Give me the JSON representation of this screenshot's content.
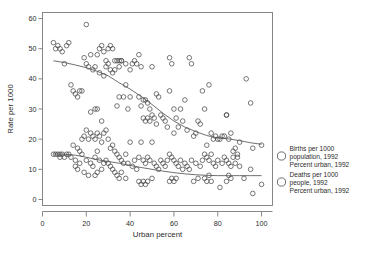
{
  "figure": {
    "clipped_header_text": "",
    "background_color": "#ffffff",
    "frame_color": "#7a7a7a",
    "marker_color": "#4a4a4a",
    "line_color": "#555555"
  },
  "axes": {
    "x": {
      "title": "Urban percent",
      "ticks": [
        0,
        20,
        40,
        60,
        80,
        100
      ],
      "min": 0,
      "max": 105
    },
    "y": {
      "title": "Rate per 1000",
      "ticks": [
        0,
        10,
        20,
        30,
        40,
        50,
        60
      ],
      "min": -2,
      "max": 62
    }
  },
  "legend": {
    "entries": [
      {
        "marker": "open-circle",
        "lines": [
          "Births per 1000",
          "population, 1992",
          "Percent urban, 1992"
        ]
      },
      {
        "marker": "open-circle",
        "lines": [
          "Deaths per 1000",
          "people, 1992",
          "Percent urban, 1992"
        ]
      }
    ]
  },
  "chart_data": {
    "type": "scatter",
    "title": "",
    "xlabel": "Urban percent",
    "ylabel": "Rate per 1000",
    "xlim": [
      0,
      105
    ],
    "ylim": [
      -2,
      62
    ],
    "xticks": [
      0,
      20,
      40,
      60,
      80,
      100
    ],
    "yticks": [
      0,
      10,
      20,
      30,
      40,
      50,
      60
    ],
    "grid": false,
    "legend_position": "right",
    "marker_style": "open circle",
    "series": [
      {
        "name": "Births per 1000 population, 1992",
        "x": [
          5,
          6,
          7,
          8,
          9,
          10,
          11,
          12,
          13,
          14,
          15,
          16,
          17,
          18,
          19,
          20,
          20,
          21,
          22,
          22,
          23,
          24,
          24,
          25,
          25,
          26,
          26,
          27,
          27,
          28,
          28,
          29,
          29,
          30,
          30,
          31,
          31,
          32,
          32,
          33,
          33,
          34,
          34,
          35,
          35,
          35,
          36,
          36,
          37,
          38,
          38,
          39,
          40,
          40,
          41,
          42,
          43,
          44,
          44,
          45,
          45,
          46,
          46,
          47,
          47,
          48,
          48,
          49,
          49,
          50,
          50,
          51,
          52,
          52,
          53,
          54,
          55,
          56,
          57,
          58,
          58,
          59,
          60,
          60,
          61,
          62,
          63,
          64,
          65,
          66,
          67,
          68,
          69,
          70,
          71,
          72,
          73,
          74,
          75,
          76,
          77,
          78,
          79,
          80,
          81,
          82,
          83,
          84,
          84,
          85,
          86,
          87,
          88,
          89,
          90,
          93,
          95,
          96,
          100
        ],
        "y": [
          52,
          50,
          51,
          50,
          49,
          45,
          51,
          52,
          38,
          36,
          35,
          34,
          36,
          36,
          47,
          58,
          45,
          44,
          48,
          29,
          43,
          44,
          30,
          48,
          30,
          50,
          42,
          51,
          26,
          49,
          41,
          46,
          44,
          50,
          45,
          51,
          43,
          50,
          42,
          46,
          43,
          46,
          31,
          46,
          44,
          34,
          46,
          46,
          34,
          45,
          38,
          30,
          43,
          34,
          45,
          46,
          45,
          48,
          34,
          44,
          31,
          33,
          27,
          33,
          26,
          32,
          27,
          30,
          26,
          44,
          28,
          27,
          35,
          25,
          34,
          28,
          27,
          26,
          24,
          47,
          36,
          45,
          30,
          22,
          27,
          24,
          30,
          26,
          33,
          23,
          47,
          45,
          21,
          22,
          26,
          25,
          36,
          30,
          18,
          38,
          22,
          20,
          21,
          20,
          20,
          21,
          21,
          28,
          28,
          20,
          22,
          16,
          17,
          14,
          19,
          40,
          32,
          17,
          18
        ]
      },
      {
        "name": "Deaths per 1000 people, 1992",
        "x": [
          5,
          6,
          7,
          8,
          8,
          9,
          10,
          11,
          12,
          13,
          14,
          15,
          15,
          16,
          16,
          17,
          17,
          18,
          18,
          19,
          19,
          20,
          20,
          21,
          21,
          22,
          22,
          23,
          23,
          24,
          24,
          24,
          25,
          25,
          25,
          26,
          26,
          27,
          27,
          28,
          28,
          29,
          29,
          30,
          30,
          31,
          31,
          32,
          32,
          33,
          33,
          34,
          34,
          35,
          35,
          36,
          36,
          37,
          38,
          38,
          39,
          40,
          41,
          42,
          43,
          44,
          44,
          45,
          45,
          46,
          46,
          47,
          47,
          48,
          48,
          49,
          50,
          50,
          51,
          52,
          53,
          54,
          55,
          56,
          57,
          58,
          58,
          59,
          59,
          60,
          60,
          61,
          61,
          62,
          63,
          64,
          65,
          66,
          67,
          68,
          69,
          70,
          71,
          72,
          73,
          74,
          74,
          75,
          75,
          76,
          76,
          77,
          77,
          78,
          79,
          80,
          81,
          82,
          83,
          84,
          84,
          85,
          85,
          86,
          86,
          87,
          88,
          89,
          90,
          92,
          95,
          96,
          100
        ],
        "y": [
          15,
          15,
          15,
          15,
          14,
          15,
          14,
          15,
          15,
          14,
          18,
          13,
          11,
          17,
          10,
          16,
          12,
          20,
          15,
          21,
          9,
          23,
          13,
          20,
          8,
          22,
          12,
          21,
          11,
          20,
          14,
          8,
          22,
          16,
          9,
          21,
          13,
          19,
          10,
          22,
          12,
          23,
          13,
          20,
          12,
          17,
          11,
          18,
          10,
          16,
          9,
          15,
          8,
          14,
          7,
          13,
          9,
          12,
          15,
          7,
          12,
          19,
          11,
          13,
          10,
          14,
          6,
          19,
          5,
          13,
          6,
          12,
          5,
          14,
          6,
          13,
          19,
          7,
          12,
          11,
          10,
          13,
          12,
          11,
          13,
          15,
          6,
          14,
          7,
          13,
          6,
          12,
          7,
          11,
          13,
          10,
          12,
          11,
          10,
          13,
          6,
          12,
          7,
          11,
          13,
          15,
          7,
          14,
          6,
          13,
          8,
          15,
          6,
          12,
          11,
          13,
          4,
          12,
          14,
          13,
          6,
          12,
          8,
          11,
          7,
          14,
          12,
          15,
          11,
          7,
          10,
          2,
          5
        ]
      }
    ],
    "trend_lines": [
      {
        "name": "births-lowess",
        "x": [
          5,
          10,
          15,
          20,
          25,
          30,
          35,
          40,
          45,
          50,
          55,
          60,
          65,
          70,
          75,
          80,
          85,
          90,
          95,
          100
        ],
        "y": [
          46,
          45.4,
          44.6,
          43.7,
          42.5,
          41.0,
          38.7,
          36.6,
          34.2,
          31.5,
          28.6,
          26.0,
          24.0,
          22.5,
          21.2,
          20.4,
          20.1,
          19.5,
          18.8,
          18.3
        ]
      },
      {
        "name": "deaths-lowess",
        "x": [
          5,
          10,
          15,
          20,
          25,
          30,
          35,
          40,
          45,
          50,
          55,
          60,
          65,
          70,
          75,
          80,
          85,
          90,
          95,
          100
        ],
        "y": [
          15.1,
          15.0,
          14.7,
          14.0,
          13.2,
          12.6,
          12.0,
          11.3,
          10.6,
          10.0,
          9.4,
          8.9,
          8.5,
          8.2,
          8.0,
          7.9,
          7.9,
          7.9,
          7.9,
          7.9
        ]
      }
    ]
  }
}
